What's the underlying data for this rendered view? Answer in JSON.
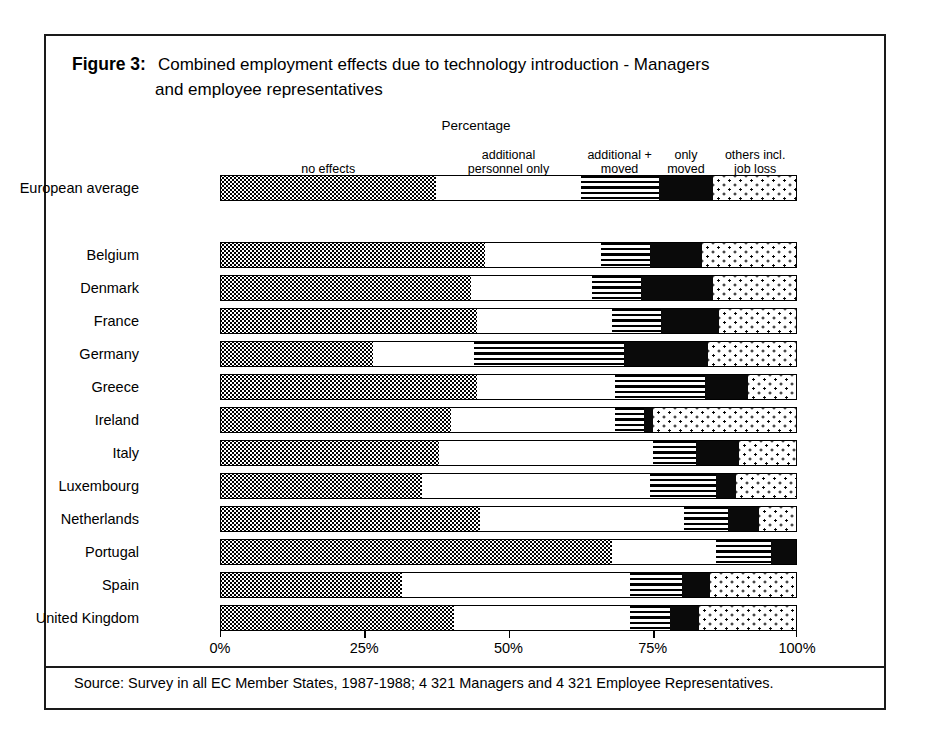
{
  "figure": {
    "label": "Figure 3:",
    "title_line1": "Combined employment effects due to technology introduction - Managers",
    "title_line2": "and employee representatives",
    "axis_caption": "Percentage",
    "source": "Source: Survey in all EC Member States, 1987-1988; 4 321 Managers and 4 321 Employee Representatives."
  },
  "chart_data": {
    "type": "bar",
    "orientation": "horizontal",
    "stacked": true,
    "normalized_percent": true,
    "title": "Combined employment effects due to technology introduction - Managers and employee representatives",
    "xlabel": "Percentage",
    "ylabel": "",
    "xlim": [
      0,
      100
    ],
    "xticks": [
      0,
      25,
      50,
      75,
      100
    ],
    "xtick_labels": [
      "0%",
      "25%",
      "50%",
      "75%",
      "100%"
    ],
    "grid": false,
    "legend_position": "top",
    "series": [
      {
        "name": "no effects",
        "pattern": "dotted-dense",
        "values": [
          37.5,
          46.0,
          43.5,
          44.5,
          26.5,
          44.5,
          40.0,
          38.0,
          35.0,
          45.0,
          68.0,
          31.5,
          40.5
        ]
      },
      {
        "name": "additional personnel only",
        "pattern": "white",
        "values": [
          25.0,
          20.0,
          21.0,
          23.5,
          17.5,
          24.0,
          28.5,
          37.0,
          39.5,
          35.5,
          18.0,
          39.5,
          30.5
        ]
      },
      {
        "name": "additional + moved",
        "pattern": "horizontal-stripes",
        "values": [
          13.5,
          8.5,
          8.5,
          8.5,
          26.0,
          15.5,
          5.0,
          7.5,
          11.5,
          7.5,
          9.5,
          9.0,
          7.0
        ]
      },
      {
        "name": "only moved",
        "pattern": "solid-black",
        "values": [
          9.5,
          9.0,
          12.5,
          10.0,
          14.5,
          7.5,
          1.5,
          7.5,
          3.5,
          5.5,
          4.5,
          5.0,
          5.0
        ]
      },
      {
        "name": "others incl. job loss",
        "pattern": "dotted-sparse",
        "values": [
          14.5,
          16.5,
          14.5,
          13.5,
          15.5,
          8.5,
          25.0,
          10.0,
          10.5,
          6.5,
          0.0,
          15.0,
          17.0
        ]
      }
    ],
    "categories": [
      "European average",
      "Belgium",
      "Denmark",
      "France",
      "Germany",
      "Greece",
      "Ireland",
      "Italy",
      "Luxembourg",
      "Netherlands",
      "Portugal",
      "Spain",
      "United Kingdom"
    ]
  },
  "legend": [
    {
      "label_line1": "no effects",
      "label_line2": ""
    },
    {
      "label_line1": "additional",
      "label_line2": "personnel only"
    },
    {
      "label_line1": "additional +",
      "label_line2": "moved"
    },
    {
      "label_line1": "only",
      "label_line2": "moved"
    },
    {
      "label_line1": "others incl.",
      "label_line2": "job loss"
    }
  ]
}
